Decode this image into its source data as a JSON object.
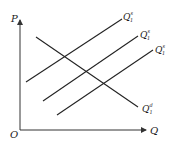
{
  "diagram": {
    "type": "supply-demand",
    "axes": {
      "y_label": "P",
      "x_label": "Q",
      "origin_label": "O"
    },
    "curves": [
      {
        "name": "supply-1",
        "label_main": "Q",
        "label_sub": "1",
        "label_sup": "s",
        "x1": 26,
        "y1": 82,
        "x2": 122,
        "y2": 19,
        "lx": 123,
        "ly": 20
      },
      {
        "name": "supply-2",
        "label_main": "Q",
        "label_sub": "1",
        "label_sup": "s",
        "x1": 43,
        "y1": 101,
        "x2": 138,
        "y2": 36,
        "lx": 140,
        "ly": 38
      },
      {
        "name": "supply-3",
        "label_main": "Q",
        "label_sub": "1",
        "label_sup": "s",
        "x1": 57,
        "y1": 115,
        "x2": 153,
        "y2": 50,
        "lx": 155,
        "ly": 53
      },
      {
        "name": "demand",
        "label_main": "Q",
        "label_sub": "1",
        "label_sup": "d",
        "x1": 36,
        "y1": 37,
        "x2": 138,
        "y2": 107,
        "lx": 142,
        "ly": 112
      }
    ],
    "colors": {
      "line": "#222222",
      "background": "#ffffff"
    }
  }
}
